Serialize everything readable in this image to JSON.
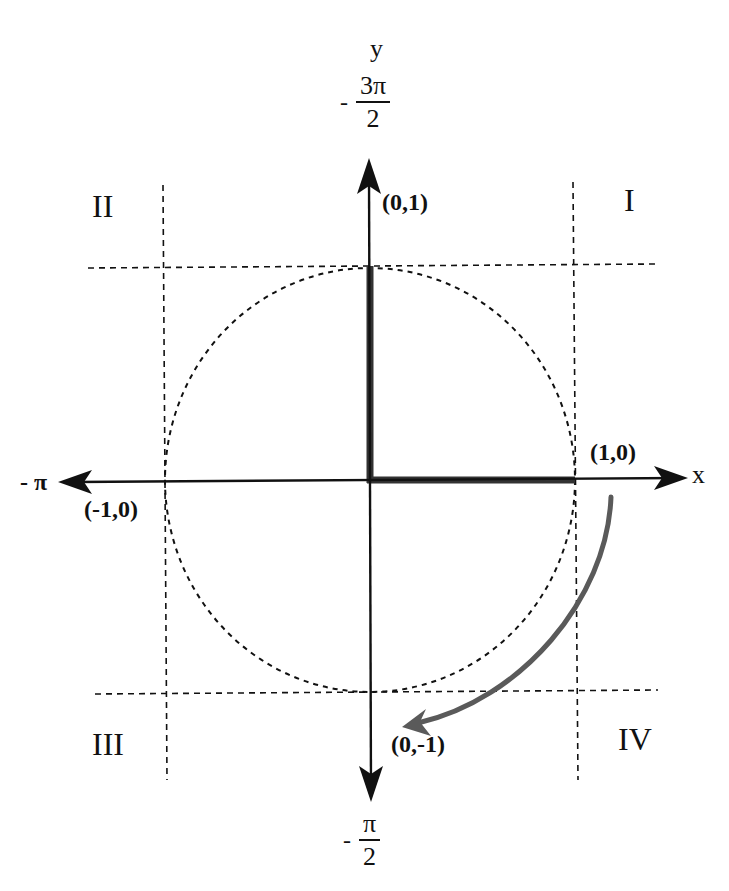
{
  "diagram": {
    "axes": {
      "x_label": "x",
      "y_label": "y",
      "left_angle": {
        "sign": "-",
        "numerator": "π",
        "denominator": ""
      },
      "top_angle": {
        "sign": "-",
        "numerator": "3π",
        "denominator": "2"
      },
      "bottom_angle": {
        "sign": "-",
        "numerator": "π",
        "denominator": "2"
      }
    },
    "points": [
      {
        "label": "(0,1)",
        "x": 0,
        "y": 1
      },
      {
        "label": "(1,0)",
        "x": 1,
        "y": 0
      },
      {
        "label": "(-1,0)",
        "x": -1,
        "y": 0
      },
      {
        "label": "(0,-1)",
        "x": 0,
        "y": -1
      }
    ],
    "quadrants": [
      {
        "label": "I",
        "position": "top-right"
      },
      {
        "label": "II",
        "position": "top-left"
      },
      {
        "label": "III",
        "position": "bottom-left"
      },
      {
        "label": "IV",
        "position": "bottom-right"
      }
    ],
    "highlighted_segments": [
      {
        "from": "(0,0)",
        "to": "(1,0)"
      },
      {
        "from": "(0,0)",
        "to": "(0,1)"
      }
    ],
    "rotation_arrow": {
      "direction": "clockwise",
      "from_quadrant": "I",
      "to_quadrant": "IV",
      "color": "#5a5a5a"
    },
    "colors": {
      "axis": "#111111",
      "highlight": "#333333",
      "dashed": "#111111",
      "rotation": "#5a5a5a",
      "background": "#ffffff"
    }
  }
}
